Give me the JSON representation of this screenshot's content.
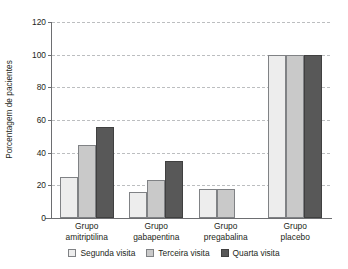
{
  "chart_data": {
    "type": "bar",
    "title": "",
    "subtitle": "",
    "xlabel": "",
    "ylabel": "Porcentagem de pacientes",
    "ylim": [
      0,
      120
    ],
    "yticks": [
      0,
      20,
      40,
      60,
      80,
      100,
      120
    ],
    "ytick_labels": [
      "0",
      "20",
      "40",
      "60",
      "80",
      "100",
      "120"
    ],
    "grid": "horizontal-dashed",
    "legend_position": "bottom-center",
    "categories": [
      "Grupo amitriptilina",
      "Grupo gabapentina",
      "Grupo pregabalina",
      "Grupo placebo"
    ],
    "category_lines": [
      [
        "Grupo",
        "amitriptilina"
      ],
      [
        "Grupo",
        "gabapentina"
      ],
      [
        "Grupo",
        "pregabalina"
      ],
      [
        "Grupo",
        "placebo"
      ]
    ],
    "series": [
      {
        "name": "Segunda visita",
        "color": "#ededed",
        "values": [
          25,
          16,
          18,
          100
        ]
      },
      {
        "name": "Terceira visita",
        "color": "#c9c9c9",
        "values": [
          45,
          23,
          18,
          100
        ]
      },
      {
        "name": "Quarta visita",
        "color": "#585858",
        "values": [
          56,
          35,
          null,
          100
        ]
      }
    ]
  },
  "legend": {
    "items": [
      {
        "label": "Segunda visita"
      },
      {
        "label": "Terceira visita"
      },
      {
        "label": "Quarta visita"
      }
    ]
  }
}
